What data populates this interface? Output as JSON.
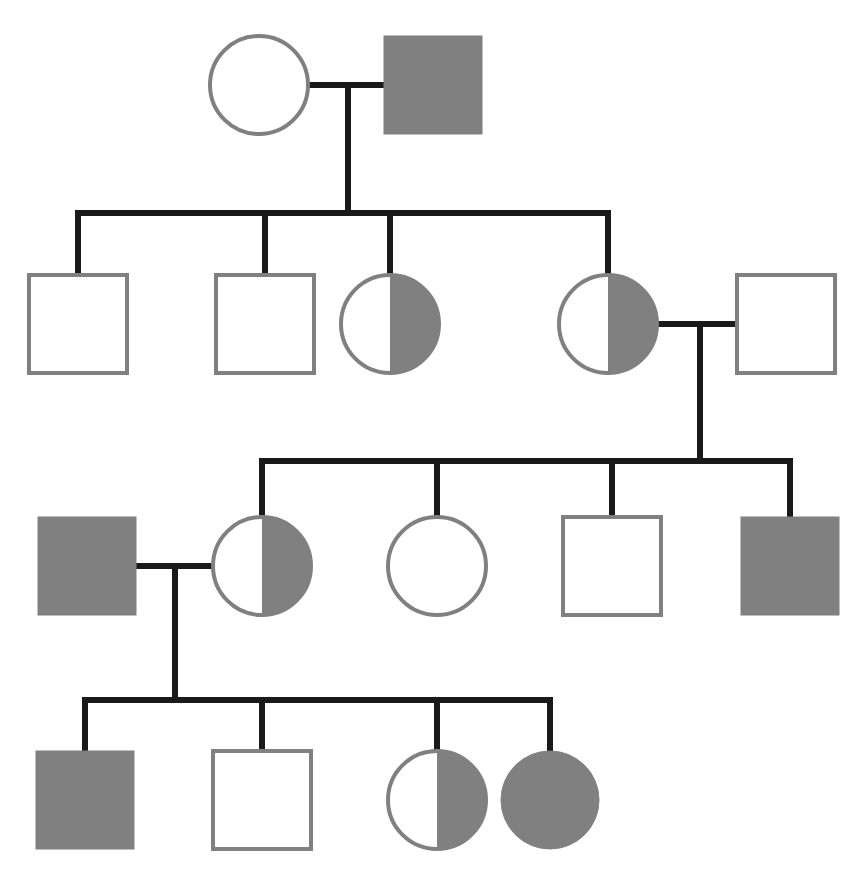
{
  "figure": {
    "kind": "pedigree-chart",
    "width": 863,
    "height": 891,
    "background_color": "#ffffff"
  },
  "style": {
    "affected_fill": "#808080",
    "unaffected_fill": "#ffffff",
    "symbol_stroke": "#808080",
    "symbol_stroke_width": 4,
    "line_color": "#1a1a1a",
    "line_width": 6,
    "square_size": 98,
    "circle_radius": 49
  },
  "legend_semantics": {
    "square": "male",
    "circle": "female",
    "filled": "affected",
    "open": "unaffected",
    "half_filled": "carrier"
  },
  "generations": [
    {
      "id": "I",
      "label": "I",
      "y": 85,
      "individuals": [
        {
          "id": "I-1",
          "shape": "circle",
          "sex": "female",
          "status": "unaffected",
          "fill": "open",
          "cx": 259,
          "cy": 85,
          "r": 49
        },
        {
          "id": "I-2",
          "shape": "square",
          "sex": "male",
          "status": "affected",
          "fill": "filled",
          "cx": 433,
          "cy": 85,
          "size": 98
        }
      ]
    },
    {
      "id": "II",
      "label": "II",
      "y": 324,
      "individuals": [
        {
          "id": "II-1",
          "shape": "square",
          "sex": "male",
          "status": "unaffected",
          "fill": "open",
          "cx": 78,
          "cy": 324,
          "size": 98
        },
        {
          "id": "II-2",
          "shape": "square",
          "sex": "male",
          "status": "unaffected",
          "fill": "open",
          "cx": 265,
          "cy": 324,
          "size": 98
        },
        {
          "id": "II-3",
          "shape": "circle",
          "sex": "female",
          "status": "carrier",
          "fill": "half",
          "cx": 390,
          "cy": 324,
          "r": 49
        },
        {
          "id": "II-4",
          "shape": "circle",
          "sex": "female",
          "status": "carrier",
          "fill": "half",
          "cx": 608,
          "cy": 324,
          "r": 49
        },
        {
          "id": "II-5",
          "shape": "square",
          "sex": "male",
          "status": "unaffected",
          "fill": "open",
          "cx": 786,
          "cy": 324,
          "size": 98
        }
      ]
    },
    {
      "id": "III",
      "label": "III",
      "y": 566,
      "individuals": [
        {
          "id": "III-1",
          "shape": "square",
          "sex": "male",
          "status": "affected",
          "fill": "filled",
          "cx": 87,
          "cy": 566,
          "size": 98
        },
        {
          "id": "III-2",
          "shape": "circle",
          "sex": "female",
          "status": "carrier",
          "fill": "half",
          "cx": 262,
          "cy": 566,
          "r": 49
        },
        {
          "id": "III-3",
          "shape": "circle",
          "sex": "female",
          "status": "unaffected",
          "fill": "open",
          "cx": 437,
          "cy": 566,
          "r": 49
        },
        {
          "id": "III-4",
          "shape": "square",
          "sex": "male",
          "status": "unaffected",
          "fill": "open",
          "cx": 612,
          "cy": 566,
          "size": 98
        },
        {
          "id": "III-5",
          "shape": "square",
          "sex": "male",
          "status": "affected",
          "fill": "filled",
          "cx": 790,
          "cy": 566,
          "size": 98
        }
      ]
    },
    {
      "id": "IV",
      "label": "IV",
      "y": 800,
      "individuals": [
        {
          "id": "IV-1",
          "shape": "square",
          "sex": "male",
          "status": "affected",
          "fill": "filled",
          "cx": 85,
          "cy": 800,
          "size": 98
        },
        {
          "id": "IV-2",
          "shape": "square",
          "sex": "male",
          "status": "unaffected",
          "fill": "open",
          "cx": 262,
          "cy": 800,
          "size": 98
        },
        {
          "id": "IV-3",
          "shape": "circle",
          "sex": "female",
          "status": "carrier",
          "fill": "half",
          "cx": 437,
          "cy": 800,
          "r": 49
        },
        {
          "id": "IV-4",
          "shape": "circle",
          "sex": "female",
          "status": "affected",
          "fill": "filled",
          "cx": 550,
          "cy": 800,
          "r": 49
        }
      ]
    }
  ],
  "matings": [
    {
      "id": "mating-I",
      "partners": [
        "I-1",
        "I-2"
      ],
      "line_y": 85,
      "x1": 308,
      "x2": 384,
      "descent_x": 348,
      "descent_y_end": 213
    },
    {
      "id": "mating-II",
      "partners": [
        "II-4",
        "II-5"
      ],
      "line_y": 324,
      "x1": 657,
      "x2": 737,
      "descent_x": 700,
      "descent_y_end": 461
    },
    {
      "id": "mating-III",
      "partners": [
        "III-1",
        "III-2"
      ],
      "line_y": 566,
      "x1": 136,
      "x2": 213,
      "descent_x": 175,
      "descent_y_end": 700
    }
  ],
  "sibships": [
    {
      "id": "sibship-II",
      "line_y": 213,
      "x_start": 78,
      "x_end": 608,
      "drop_x": [
        78,
        265,
        390,
        608
      ],
      "drop_y_end": 275,
      "children": [
        "II-1",
        "II-2",
        "II-3",
        "II-4"
      ]
    },
    {
      "id": "sibship-III",
      "line_y": 461,
      "x_start": 262,
      "x_end": 790,
      "drop_x": [
        262,
        437,
        612,
        790
      ],
      "drop_y_end": 517,
      "children": [
        "III-2",
        "III-3",
        "III-4",
        "III-5"
      ]
    },
    {
      "id": "sibship-IV",
      "line_y": 700,
      "x_start": 85,
      "x_end": 550,
      "drop_x": [
        85,
        262,
        437,
        550
      ],
      "drop_y_end": 751,
      "children": [
        "IV-1",
        "IV-2",
        "IV-3",
        "IV-4"
      ]
    }
  ]
}
